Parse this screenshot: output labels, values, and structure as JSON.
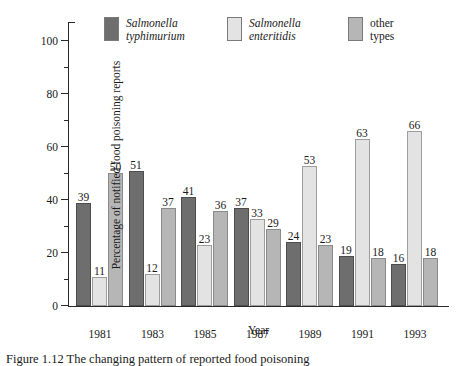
{
  "chart_data": {
    "type": "bar",
    "title": "",
    "xlabel": "Year",
    "ylabel": "Percentage of notified food poisoning reports",
    "categories": [
      "1981",
      "1983",
      "1985",
      "1987",
      "1989",
      "1991",
      "1993"
    ],
    "ylim": [
      0,
      100
    ],
    "yticks": [
      0,
      20,
      40,
      60,
      80,
      100
    ],
    "yticks_minor": [
      10,
      30,
      50,
      70,
      90
    ],
    "grid": false,
    "legend_position": "top",
    "series": [
      {
        "name": "Salmonella typhimurium",
        "name_line1": "Salmonella",
        "name_line2": "typhimurium",
        "italic": true,
        "color": "#6e6e6e",
        "values": [
          39,
          51,
          41,
          37,
          24,
          19,
          16
        ]
      },
      {
        "name": "Salmonella enteritidis",
        "name_line1": "Salmonella",
        "name_line2": "enteritidis",
        "italic": true,
        "color": "#e3e3e3",
        "values": [
          11,
          12,
          23,
          33,
          53,
          63,
          66
        ]
      },
      {
        "name": "other types",
        "name_line1": "other",
        "name_line2": "types",
        "italic": false,
        "color": "#b6b6b6",
        "values": [
          50,
          37,
          36,
          29,
          23,
          18,
          18
        ]
      }
    ]
  },
  "caption": {
    "text": "Figure 1.12 The changing pattern of reported food poisoning"
  }
}
